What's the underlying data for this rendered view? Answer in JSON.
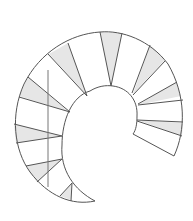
{
  "diagram": {
    "type": "spiral-staircase-plan",
    "stroke_color": "#555555",
    "fill_shade": "#e6e6e6",
    "background": "#ffffff",
    "tread_count": 15,
    "has_handrail_line": true
  }
}
